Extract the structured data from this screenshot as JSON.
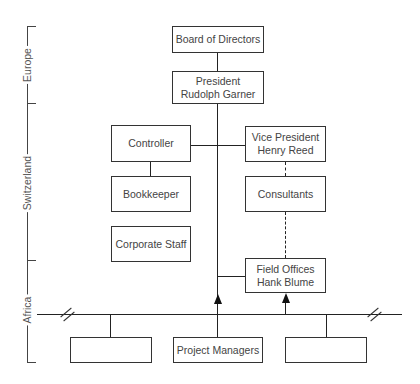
{
  "regions": [
    {
      "label": "Europe"
    },
    {
      "label": "Switzerland"
    },
    {
      "label": "Africa"
    }
  ],
  "nodes": {
    "board": {
      "line1": "Board of Directors"
    },
    "president": {
      "line1": "President",
      "line2": "Rudolph Garner"
    },
    "controller": {
      "line1": "Controller"
    },
    "vice_president": {
      "line1": "Vice President",
      "line2": "Henry Reed"
    },
    "bookkeeper": {
      "line1": "Bookkeeper"
    },
    "consultants": {
      "line1": "Consultants"
    },
    "corporate_staff": {
      "line1": "Corporate Staff"
    },
    "field_offices": {
      "line1": "Field Offices",
      "line2": "Hank Blume"
    },
    "project_managers": {
      "line1": "Project Managers"
    },
    "project_left": {
      "line1": ""
    },
    "project_right": {
      "line1": ""
    }
  },
  "colors": {
    "line": "#222222",
    "text": "#444444",
    "background": "#ffffff"
  }
}
